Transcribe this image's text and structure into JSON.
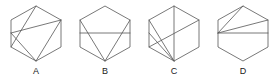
{
  "figure": {
    "background_color": "#ffffff",
    "stroke_color": "#555555",
    "label_color": "#1a1a1a",
    "stroke_width": 0.8,
    "panel_count": 4
  },
  "panels": [
    {
      "label": "A",
      "name": "hexagon-a",
      "description": "Regular hexagon with two internal chords forming a crossing rhombus",
      "hexagon": {
        "vertices": [
          [
            33,
            6
          ],
          [
            58,
            20
          ],
          [
            58,
            47
          ],
          [
            33,
            61
          ],
          [
            8,
            47
          ],
          [
            8,
            20
          ]
        ]
      },
      "internal_lines": [
        {
          "from": [
            33,
            6
          ],
          "to": [
            8,
            47
          ]
        },
        {
          "from": [
            8,
            33
          ],
          "to": [
            58,
            20
          ]
        },
        {
          "from": [
            8,
            33
          ],
          "to": [
            33,
            61
          ]
        },
        {
          "from": [
            58,
            20
          ],
          "to": [
            33,
            61
          ]
        }
      ]
    },
    {
      "label": "B",
      "name": "hexagon-b",
      "description": "Regular hexagon with horizontal diameter and two diagonals forming inverted triangle",
      "hexagon": {
        "vertices": [
          [
            33,
            6
          ],
          [
            58,
            20
          ],
          [
            58,
            47
          ],
          [
            33,
            61
          ],
          [
            8,
            47
          ],
          [
            8,
            20
          ]
        ]
      },
      "internal_lines": [
        {
          "from": [
            8,
            33
          ],
          "to": [
            58,
            33
          ]
        },
        {
          "from": [
            8,
            20
          ],
          "to": [
            33,
            61
          ]
        },
        {
          "from": [
            58,
            20
          ],
          "to": [
            33,
            61
          ]
        }
      ]
    },
    {
      "label": "C",
      "name": "hexagon-c",
      "description": "Regular hexagon with multiple chords converging at the bottom-right vertex",
      "hexagon": {
        "vertices": [
          [
            33,
            6
          ],
          [
            58,
            20
          ],
          [
            58,
            47
          ],
          [
            33,
            61
          ],
          [
            8,
            47
          ],
          [
            8,
            20
          ]
        ]
      },
      "internal_lines": [
        {
          "from": [
            8,
            20
          ],
          "to": [
            33,
            61
          ]
        },
        {
          "from": [
            58,
            20
          ],
          "to": [
            8,
            47
          ]
        },
        {
          "from": [
            8,
            33
          ],
          "to": [
            33,
            61
          ]
        },
        {
          "from": [
            33,
            6
          ],
          "to": [
            33,
            61
          ]
        }
      ]
    },
    {
      "label": "D",
      "name": "hexagon-d",
      "description": "Regular hexagon with horizontal diameter and one diagonal to the top-right vertex",
      "hexagon": {
        "vertices": [
          [
            33,
            6
          ],
          [
            58,
            20
          ],
          [
            58,
            47
          ],
          [
            33,
            61
          ],
          [
            8,
            47
          ],
          [
            8,
            20
          ]
        ]
      },
      "internal_lines": [
        {
          "from": [
            8,
            33
          ],
          "to": [
            58,
            33
          ]
        },
        {
          "from": [
            8,
            33
          ],
          "to": [
            58,
            20
          ]
        },
        {
          "from": [
            8,
            33
          ],
          "to": [
            33,
            6
          ]
        }
      ]
    }
  ]
}
